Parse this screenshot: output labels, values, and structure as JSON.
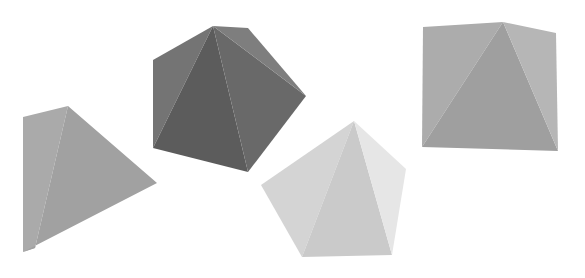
{
  "scene": {
    "width": 585,
    "height": 278,
    "background": "#ffffff",
    "description": "Four shaded pyramids viewed from above, differing in brightness"
  },
  "shapes": [
    {
      "id": "pyramid-1",
      "label": "medium gray quadrilateral pyramid",
      "faces": [
        {
          "points": "23,117 68,106 35,248 23,252",
          "fill": "#aaaaaa"
        },
        {
          "points": "68,106 157,183 23,252 35,248",
          "fill": "#a1a1a1"
        }
      ]
    },
    {
      "id": "pyramid-2",
      "label": "dark gray pentagonal pyramid",
      "faces": [
        {
          "points": "213,26 153,60 153,148",
          "fill": "#747474"
        },
        {
          "points": "213,26 153,148 248,172",
          "fill": "#5c5c5c"
        },
        {
          "points": "213,26 248,172 306,96",
          "fill": "#696969"
        },
        {
          "points": "213,26 306,96 248,28",
          "fill": "#7e7e7e"
        }
      ]
    },
    {
      "id": "pyramid-3",
      "label": "light gray pentagonal pyramid",
      "faces": [
        {
          "points": "354,121 261,185 302,257",
          "fill": "#d4d4d4"
        },
        {
          "points": "354,121 302,257 392,255",
          "fill": "#cacaca"
        },
        {
          "points": "354,121 392,255 406,169",
          "fill": "#e6e6e6"
        }
      ]
    },
    {
      "id": "pyramid-4",
      "label": "medium gray square pyramid",
      "faces": [
        {
          "points": "423,27 503,22 422,147",
          "fill": "#acacac"
        },
        {
          "points": "503,22 422,147 558,151",
          "fill": "#9f9f9f"
        },
        {
          "points": "503,22 556,33 558,151",
          "fill": "#b6b6b6"
        }
      ]
    }
  ]
}
